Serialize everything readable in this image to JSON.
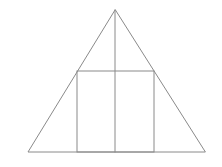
{
  "diagram": {
    "stroke_color": "#8a8a8a",
    "background": "#ffffff",
    "stroke_width": 1,
    "triangle": {
      "apex": [
        115,
        10
      ],
      "base_left": [
        28,
        152
      ],
      "base_right": [
        205,
        152
      ]
    },
    "rectangle": {
      "x": 77,
      "y": 71,
      "width": 77,
      "height": 81
    },
    "median": {
      "x1": 115,
      "y1": 10,
      "x2": 115,
      "y2": 152
    }
  }
}
